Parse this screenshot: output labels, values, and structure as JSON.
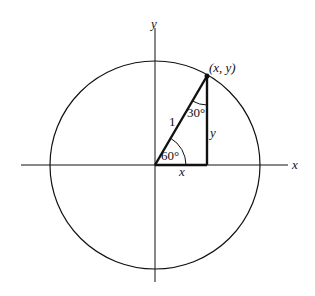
{
  "diagram": {
    "axes": {
      "x_label": "x",
      "y_label": "y"
    },
    "point_label": "(x, y)",
    "hypotenuse_label": "1",
    "horizontal_leg_label": "x",
    "vertical_leg_label": "y",
    "angle_at_origin": "60°",
    "angle_at_point": "30°",
    "colors": {
      "stroke": "#111111",
      "background": "#ffffff"
    }
  }
}
